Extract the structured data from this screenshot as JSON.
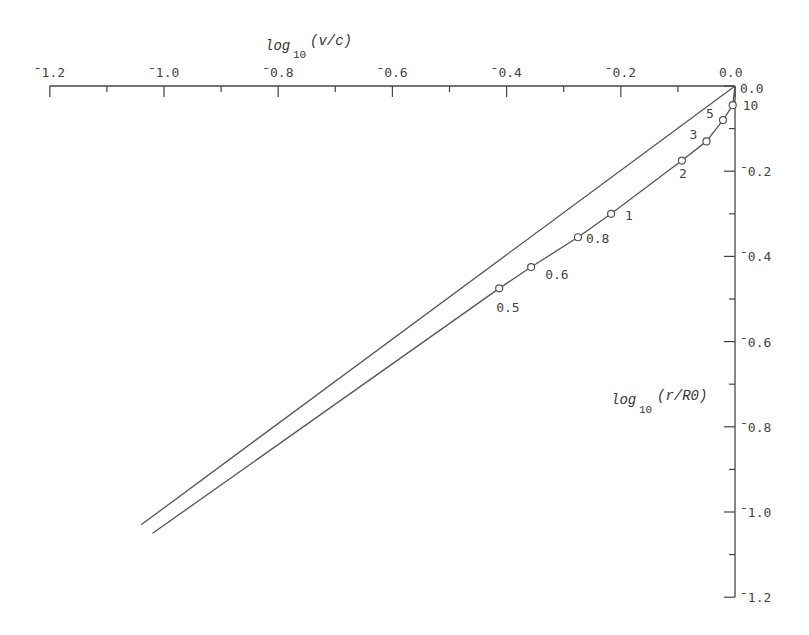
{
  "chart_data": {
    "type": "line",
    "title": "",
    "xlabel": "log10(v/c)",
    "ylabel": "log10(r/R0)",
    "xlabel_main": "log",
    "xlabel_sub": "10",
    "xlabel_arg": "(v/c)",
    "ylabel_main": "log",
    "ylabel_sub": "10",
    "ylabel_arg": "(r/R0)",
    "xlim": [
      -1.2,
      0.0
    ],
    "ylim": [
      -1.2,
      0.0
    ],
    "x_axis_position": "top",
    "y_axis_position": "right",
    "grid": false,
    "x_ticks": [
      "-1.2",
      "-1.0",
      "-0.8",
      "-0.6",
      "-0.4",
      "-0.2",
      "0.0"
    ],
    "y_ticks": [
      "0.0",
      "-0.2",
      "-0.4",
      "-0.6",
      "-0.8",
      "-1.0",
      "-1.2"
    ],
    "series": [
      {
        "name": "straight line",
        "x": [
          0.0,
          -1.04
        ],
        "y": [
          0.0,
          -1.03
        ]
      },
      {
        "name": "curve with markers",
        "x": [
          0.0,
          -0.004,
          -0.021,
          -0.05,
          -0.093,
          -0.217,
          -0.275,
          -0.357,
          -0.413,
          -1.02
        ],
        "y": [
          0.0,
          -0.045,
          -0.08,
          -0.13,
          -0.175,
          -0.3,
          -0.355,
          -0.425,
          -0.475,
          -1.05
        ]
      }
    ],
    "markers": [
      {
        "label": "10",
        "x": -0.004,
        "y": -0.045
      },
      {
        "label": "5",
        "x": -0.021,
        "y": -0.08
      },
      {
        "label": "3",
        "x": -0.05,
        "y": -0.13
      },
      {
        "label": "2",
        "x": -0.093,
        "y": -0.175
      },
      {
        "label": "1",
        "x": -0.217,
        "y": -0.3
      },
      {
        "label": "0.8",
        "x": -0.275,
        "y": -0.355
      },
      {
        "label": "0.6",
        "x": -0.357,
        "y": -0.425
      },
      {
        "label": "0.5",
        "x": -0.413,
        "y": -0.475
      }
    ],
    "colors": {
      "line": "#555555",
      "axis": "#444444",
      "text": "#444444"
    }
  }
}
